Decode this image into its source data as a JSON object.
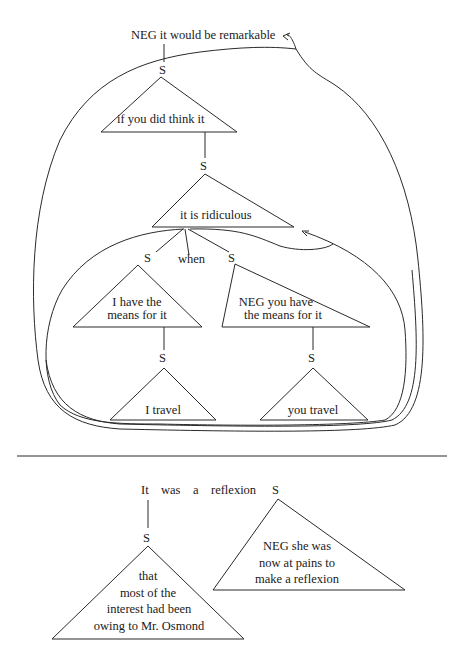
{
  "top_diagram": {
    "root_label": "NEG it would be remarkable",
    "node_s_1": "S",
    "triangle_1": {
      "lines": [
        "if you did think it"
      ]
    },
    "node_s_2": "S",
    "triangle_2": {
      "lines": [
        "it is ridiculous"
      ]
    },
    "branch_left_s": "S",
    "branch_when": "when",
    "branch_right_s": "S",
    "triangle_left": {
      "lines": [
        "I have the",
        "means for it"
      ]
    },
    "triangle_right": {
      "lines": [
        "NEG you have",
        "the means for it"
      ]
    },
    "node_s_left_lower": "S",
    "node_s_right_lower": "S",
    "triangle_left_lower": {
      "lines": [
        "I travel"
      ]
    },
    "triangle_right_lower": {
      "lines": [
        "you travel"
      ]
    }
  },
  "bottom_diagram": {
    "head_words": [
      "It",
      "was",
      "a",
      "reflexion"
    ],
    "head_s": "S",
    "node_s_left": "S",
    "triangle_left": {
      "lines": [
        "that",
        "most of the",
        "interest had been",
        "owing to Mr. Osmond"
      ]
    },
    "triangle_right": {
      "lines": [
        "NEG she was",
        "now at pains to",
        "make a reflexion"
      ]
    }
  },
  "colors": {
    "ink": "#2a2a2a",
    "background": "#ffffff"
  }
}
